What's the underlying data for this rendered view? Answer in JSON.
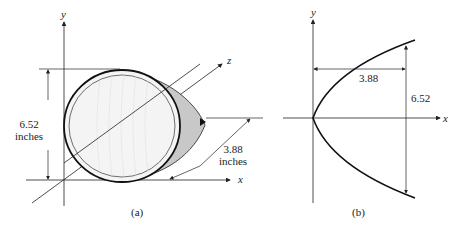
{
  "figure_a": {
    "caption": "(a)",
    "axes": {
      "x": "x",
      "y": "y",
      "z": "z"
    },
    "height_label": {
      "value": "6.52",
      "unit": "inches"
    },
    "depth_label": {
      "value": "3.88",
      "unit": "inches"
    }
  },
  "figure_b": {
    "caption": "(b)",
    "axes": {
      "x": "x",
      "y": "y"
    },
    "width_label": "3.88",
    "height_label": "6.52"
  },
  "colors": {
    "line": "#222222",
    "dish_shade": "#c8c8c8",
    "dish_face": "#f4f4f4"
  }
}
